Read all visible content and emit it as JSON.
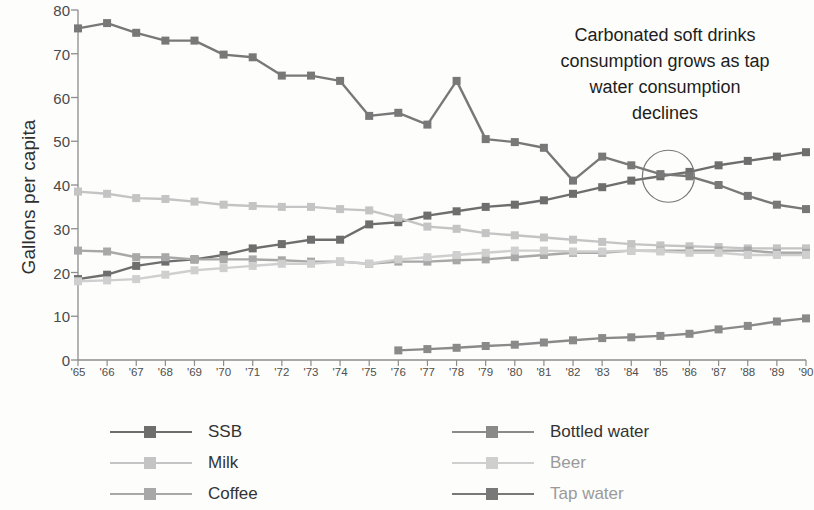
{
  "chart_data": {
    "type": "line",
    "title": "",
    "xlabel": "",
    "ylabel": "Gallons per capita",
    "ylim": [
      0,
      80
    ],
    "yticks": [
      0,
      10,
      20,
      30,
      40,
      50,
      60,
      70,
      80
    ],
    "grid": false,
    "legend_position": "bottom",
    "x": [
      "'65",
      "'66",
      "'67",
      "'68",
      "'69",
      "'70",
      "'71",
      "'72",
      "'73",
      "'74",
      "'75",
      "'76",
      "'77",
      "'78",
      "'79",
      "'80",
      "'81",
      "'82",
      "'83",
      "'84",
      "'85",
      "'86",
      "'87",
      "'88",
      "'89",
      "'90"
    ],
    "categories": [
      "'65",
      "'66",
      "'67",
      "'68",
      "'69",
      "'70",
      "'71",
      "'72",
      "'73",
      "'74",
      "'75",
      "'76",
      "'77",
      "'78",
      "'79",
      "'80",
      "'81",
      "'82",
      "'83",
      "'84",
      "'85",
      "'86",
      "'87",
      "'88",
      "'89",
      "'90"
    ],
    "series": [
      {
        "name": "SSB",
        "color": "#6e6e6e",
        "values": [
          18.5,
          19.5,
          21.5,
          22.5,
          23.0,
          24.0,
          25.5,
          26.5,
          27.5,
          27.5,
          31.0,
          31.5,
          33.0,
          34.0,
          35.0,
          35.5,
          36.5,
          38.0,
          39.5,
          41.0,
          42.0,
          43.0,
          44.5,
          45.5,
          46.5,
          47.5
        ]
      },
      {
        "name": "Milk",
        "color": "#c4c4c4",
        "values": [
          38.5,
          38.0,
          37.0,
          36.8,
          36.2,
          35.5,
          35.2,
          35.0,
          35.0,
          34.5,
          34.2,
          32.5,
          30.5,
          30.0,
          29.0,
          28.5,
          28.0,
          27.5,
          27.0,
          26.5,
          26.2,
          26.0,
          25.8,
          25.5,
          25.5,
          25.5
        ]
      },
      {
        "name": "Coffee",
        "color": "#a8a8a8",
        "values": [
          25.0,
          24.8,
          23.5,
          23.5,
          23.0,
          23.0,
          23.0,
          22.8,
          22.5,
          22.5,
          22.0,
          22.5,
          22.5,
          22.8,
          23.0,
          23.5,
          24.0,
          24.5,
          24.5,
          25.0,
          25.0,
          25.0,
          25.0,
          25.0,
          24.5,
          24.5
        ]
      },
      {
        "name": "Bottled water",
        "color": "#8a8a8a",
        "values": [
          null,
          null,
          null,
          null,
          null,
          null,
          null,
          null,
          null,
          null,
          null,
          2.2,
          2.5,
          2.8,
          3.2,
          3.5,
          4.0,
          4.5,
          5.0,
          5.2,
          5.5,
          6.0,
          7.0,
          7.8,
          8.8,
          9.5
        ]
      },
      {
        "name": "Beer",
        "color": "#cfcfcf",
        "values": [
          18.0,
          18.2,
          18.5,
          19.5,
          20.5,
          21.0,
          21.5,
          22.0,
          22.0,
          22.5,
          22.0,
          23.0,
          23.5,
          24.0,
          24.5,
          25.0,
          25.0,
          24.8,
          24.8,
          25.0,
          24.8,
          24.5,
          24.5,
          24.0,
          24.0,
          24.0
        ]
      },
      {
        "name": "Tap water",
        "color": "#787878",
        "values": [
          75.8,
          77.0,
          74.8,
          73.0,
          73.0,
          69.8,
          69.2,
          65.0,
          65.0,
          63.8,
          55.8,
          56.5,
          53.8,
          63.8,
          50.5,
          49.8,
          48.5,
          41.0,
          46.5,
          44.5,
          42.5,
          42.0,
          40.0,
          37.5,
          35.5,
          34.5
        ]
      }
    ],
    "annotation": {
      "lines": [
        "Carbonated soft drinks",
        "consumption grows as tap",
        "water consumption",
        "declines"
      ],
      "highlight_shape": "circle",
      "highlight_center_year": "'85",
      "highlight_center_value": 42
    }
  },
  "legend": {
    "left_column": [
      {
        "label": "SSB"
      },
      {
        "label": "Milk"
      },
      {
        "label": "Coffee"
      }
    ],
    "right_column": [
      {
        "label": "Bottled water"
      },
      {
        "label": "Beer"
      },
      {
        "label": "Tap water"
      }
    ]
  }
}
